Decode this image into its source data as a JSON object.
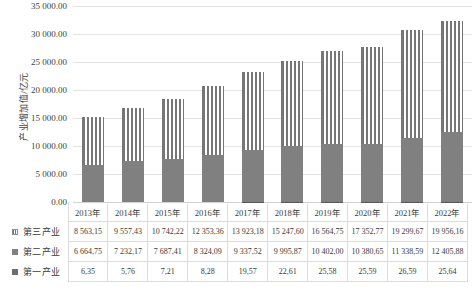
{
  "chart_data": {
    "type": "bar",
    "stacked": true,
    "title": "",
    "xlabel": "",
    "ylabel": "产业增加值/亿元",
    "ylim": [
      0,
      35000
    ],
    "ytick_step": 5000,
    "grid": true,
    "legend_position": "table-left",
    "categories": [
      "2013年",
      "2014年",
      "2015年",
      "2016年",
      "2017年",
      "2018年",
      "2019年",
      "2020年",
      "2021年",
      "2022年"
    ],
    "ytick_labels": [
      "35 000.00",
      "30 000.00",
      "25 000.00",
      "20 000.00",
      "15 000.00",
      "10 000.00",
      "5 000.00",
      "0.00"
    ],
    "ytick_values": [
      35000,
      30000,
      25000,
      20000,
      15000,
      10000,
      5000,
      0
    ],
    "series": [
      {
        "name": "第三产业",
        "swatch": "sw-tertiary",
        "seg_class": "seg-tertiary",
        "values": [
          8563.15,
          9557.43,
          10742.22,
          12353.36,
          13923.18,
          15247.6,
          16564.75,
          17352.77,
          19299.67,
          19956.16
        ],
        "labels": [
          "8 563,15",
          "9 557,43",
          "10 742,22",
          "12 353,36",
          "13 923,18",
          "15 247,60",
          "16 564,75",
          "17 352,77",
          "19 299,67",
          "19 956,16"
        ]
      },
      {
        "name": "第二产业",
        "swatch": "sw-secondary",
        "seg_class": "seg-secondary",
        "values": [
          6664.75,
          7232.17,
          7687.41,
          8324.09,
          9337.52,
          9995.87,
          10402.0,
          10380.65,
          11338.59,
          12405.88
        ],
        "labels": [
          "6 664,75",
          "7 232,17",
          "7 687,41",
          "8 324,09",
          "9 337,52",
          "9 995,87",
          "10 402,00",
          "10 380,65",
          "11 338,59",
          "12 405,88"
        ]
      },
      {
        "name": "第一产业",
        "swatch": "sw-primary",
        "seg_class": "seg-primary",
        "values": [
          6.35,
          5.76,
          7.21,
          8.28,
          19.57,
          22.61,
          25.58,
          25.59,
          26.59,
          25.64
        ],
        "labels": [
          "6,35",
          "5,76",
          "7,21",
          "8,28",
          "19,57",
          "22,61",
          "25,58",
          "25,59",
          "26,59",
          "25,64"
        ]
      }
    ],
    "colors": {
      "secondary_fill": "#808080",
      "tertiary_stripe": "#767676",
      "gridline": "#e3e3e3",
      "text": "#3a3a3a"
    }
  }
}
